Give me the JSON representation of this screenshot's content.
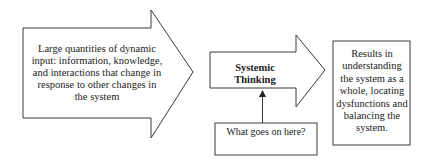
{
  "diagram": {
    "input_arrow": {
      "label": "Large quantities of dynamic input: information, knowledge, and interactions that change in response to other changes in the system"
    },
    "core_arrow": {
      "label_line1": "Systemic",
      "label_line2": "Thinking"
    },
    "result_box": {
      "label": "Results in understanding the system as a whole, locating dysfunctions and balancing the system."
    },
    "question_box": {
      "label": "What goes on here?"
    },
    "colors": {
      "stroke": "#3a3a3a",
      "fill": "#ffffff",
      "text": "#222222"
    }
  }
}
